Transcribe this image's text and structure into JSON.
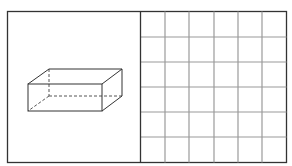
{
  "figure": {
    "left_panel": {
      "shape": "rectangular-prism",
      "style": "wireframe with hidden edges dashed"
    },
    "right_panel": {
      "shape": "square-grid",
      "rows": 6,
      "columns": 6
    },
    "colors": {
      "frame": "#333333",
      "grid_lines": "#9a9a9a",
      "prism_edges": "#333333",
      "background": "#ffffff"
    }
  }
}
